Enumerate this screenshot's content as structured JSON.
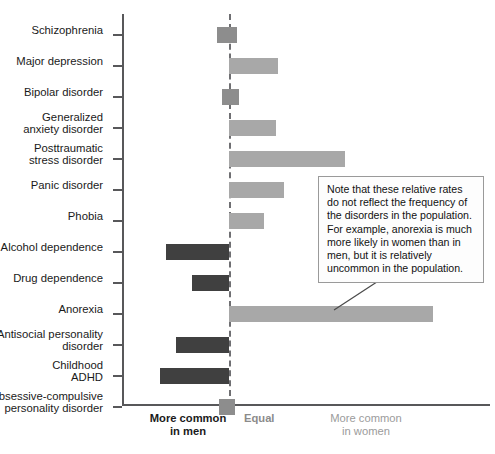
{
  "chart_data": {
    "type": "bar",
    "title": "",
    "subtitle": "",
    "xlabel": "",
    "ylabel": "",
    "orientation": "horizontal",
    "grid": false,
    "legend": "none",
    "axis_note": "Diverging bar chart centered on an 'Equal' reference line; bars to the left indicate the disorder is more common in men, bars to the right indicate more common in women.",
    "xlim": [
      -1.0,
      1.0
    ],
    "zero_reference_label": "Equal",
    "categories": [
      "Schizophrenia",
      "Major depression",
      "Bipolar disorder",
      "Generalized anxiety disorder",
      "Posttraumatic stress disorder",
      "Panic disorder",
      "Phobia",
      "Alcohol dependence",
      "Drug dependence",
      "Anorexia",
      "Antisocial personality disorder",
      "Childhood ADHD",
      "Obsessive-compulsive personality disorder"
    ],
    "category_lines": [
      [
        "Schizophrenia"
      ],
      [
        "Major depression"
      ],
      [
        "Bipolar disorder"
      ],
      [
        "Generalized",
        "anxiety disorder"
      ],
      [
        "Posttraumatic",
        "stress disorder"
      ],
      [
        "Panic disorder"
      ],
      [
        "Phobia"
      ],
      [
        "Alcohol dependence"
      ],
      [
        "Drug dependence"
      ],
      [
        "Anorexia"
      ],
      [
        "Antisocial personality",
        "disorder"
      ],
      [
        "Childhood",
        "ADHD"
      ],
      [
        "Obsessive-compulsive",
        "personality disorder"
      ]
    ],
    "values": [
      0.04,
      0.24,
      0.05,
      0.23,
      0.57,
      0.27,
      0.17,
      -0.31,
      -0.18,
      1.0,
      -0.26,
      -0.34,
      0.03
    ],
    "bar_directions": [
      "women",
      "women",
      "women",
      "women",
      "women",
      "women",
      "women",
      "men",
      "men",
      "women",
      "men",
      "men",
      "women"
    ],
    "bars": [
      {
        "category": "Schizophrenia",
        "value": 0.04,
        "direction": "women",
        "straddles_zero": true,
        "left_px": -0.06,
        "right_px": 0.04
      },
      {
        "category": "Major depression",
        "value": 0.24,
        "direction": "women",
        "straddles_zero": false,
        "left_px": 0.0,
        "right_px": 0.24
      },
      {
        "category": "Bipolar disorder",
        "value": 0.05,
        "direction": "women",
        "straddles_zero": true,
        "left_px": -0.035,
        "right_px": 0.05
      },
      {
        "category": "Generalized anxiety disorder",
        "value": 0.23,
        "direction": "women",
        "straddles_zero": false,
        "left_px": 0.0,
        "right_px": 0.23
      },
      {
        "category": "Posttraumatic stress disorder",
        "value": 0.57,
        "direction": "women",
        "straddles_zero": false,
        "left_px": 0.0,
        "right_px": 0.57
      },
      {
        "category": "Panic disorder",
        "value": 0.27,
        "direction": "women",
        "straddles_zero": false,
        "left_px": 0.0,
        "right_px": 0.27
      },
      {
        "category": "Phobia",
        "value": 0.17,
        "direction": "women",
        "straddles_zero": false,
        "left_px": 0.0,
        "right_px": 0.17
      },
      {
        "category": "Alcohol dependence",
        "value": -0.31,
        "direction": "men",
        "straddles_zero": false,
        "left_px": -0.31,
        "right_px": 0.0
      },
      {
        "category": "Drug dependence",
        "value": -0.18,
        "direction": "men",
        "straddles_zero": false,
        "left_px": -0.18,
        "right_px": 0.0
      },
      {
        "category": "Anorexia",
        "value": 1.0,
        "direction": "women",
        "straddles_zero": false,
        "left_px": 0.0,
        "right_px": 1.0
      },
      {
        "category": "Antisocial personality disorder",
        "value": -0.26,
        "direction": "men",
        "straddles_zero": false,
        "left_px": -0.26,
        "right_px": 0.0
      },
      {
        "category": "Childhood ADHD",
        "value": -0.34,
        "direction": "men",
        "straddles_zero": false,
        "left_px": -0.34,
        "right_px": 0.0
      },
      {
        "category": "Obsessive-compulsive personality disorder",
        "value": 0.03,
        "direction": "women",
        "straddles_zero": true,
        "left_px": -0.05,
        "right_px": 0.03
      }
    ],
    "colors": {
      "more_common_in_women": "#a8a8a8",
      "more_common_in_men": "#404040",
      "straddling_zero": "#8d8d8d",
      "axis": "#58585a",
      "zero_line": "#6f6f72",
      "callout_border": "#9a9a9a",
      "callout_background": "#fdfdfd"
    }
  },
  "footer": {
    "men_line1": "More common",
    "men_line2": "in men",
    "equal": "Equal",
    "women_line1": "More common",
    "women_line2": "in women"
  },
  "callout": {
    "text": "Note that these relative rates do not reflect the frequency of the disorders in the population. For example, anorexia is much more likely in women than in men, but it is relatively uncommon in the population."
  }
}
